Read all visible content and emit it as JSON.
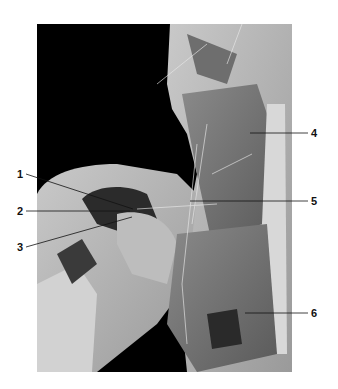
{
  "figure": {
    "labels": [
      {
        "id": "1",
        "text": "1",
        "x": 17,
        "y": 168
      },
      {
        "id": "2",
        "text": "2",
        "x": 17,
        "y": 205
      },
      {
        "id": "3",
        "text": "3",
        "x": 17,
        "y": 241
      },
      {
        "id": "4",
        "text": "4",
        "x": 311,
        "y": 127
      },
      {
        "id": "5",
        "text": "5",
        "x": 311,
        "y": 195
      },
      {
        "id": "6",
        "text": "6",
        "x": 311,
        "y": 307
      }
    ],
    "colors": {
      "background": "#ffffff",
      "photo_bg": "#000000",
      "label": "#111111"
    }
  }
}
